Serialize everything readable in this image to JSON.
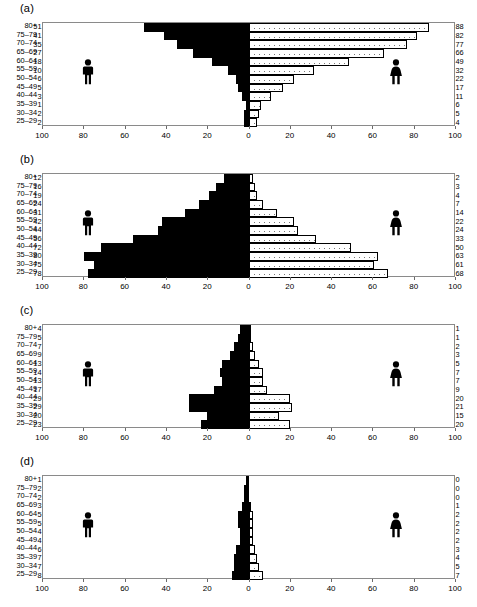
{
  "figure": {
    "axis": {
      "y_categories": [
        "80+",
        "75–79",
        "70–74",
        "65–69",
        "60–64",
        "55–59",
        "50–54",
        "45–49",
        "40–44",
        "35–39",
        "30–34",
        "25–29"
      ],
      "x_ticks": [
        "100",
        "80",
        "60",
        "40",
        "20",
        "0",
        "20",
        "40",
        "60",
        "80",
        "100"
      ],
      "x_max": 100
    },
    "icons": {
      "male": "male-figure-icon",
      "female": "female-figure-icon"
    }
  },
  "chart_data": [
    {
      "type": "bar",
      "title": "(a)",
      "subtitle": "",
      "xlabel": "",
      "ylabel": "",
      "orientation": "population-pyramid",
      "categories": [
        "80+",
        "75–79",
        "70–74",
        "65–69",
        "60–64",
        "55–59",
        "50–54",
        "45–49",
        "40–44",
        "35–39",
        "30–34",
        "25–29"
      ],
      "xlim": [
        0,
        100
      ],
      "grid": false,
      "legend": "figure-icons",
      "series": [
        {
          "name": "male",
          "side": "left",
          "fill": "solid-black",
          "values": [
            51,
            41,
            35,
            27,
            18,
            10,
            6,
            5,
            3,
            1,
            2,
            2
          ]
        },
        {
          "name": "female",
          "side": "right",
          "fill": "stippled",
          "values": [
            88,
            82,
            77,
            66,
            49,
            32,
            22,
            17,
            11,
            6,
            5,
            4
          ]
        }
      ]
    },
    {
      "type": "bar",
      "title": "(b)",
      "subtitle": "",
      "xlabel": "",
      "ylabel": "",
      "orientation": "population-pyramid",
      "categories": [
        "80+",
        "75–79",
        "70–74",
        "65–69",
        "60–64",
        "55–59",
        "50–54",
        "45–49",
        "40–44",
        "35–39",
        "30–34",
        "25–29"
      ],
      "xlim": [
        0,
        100
      ],
      "grid": false,
      "legend": "figure-icons",
      "series": [
        {
          "name": "male",
          "side": "left",
          "fill": "solid-black",
          "values": [
            12,
            16,
            19,
            24,
            31,
            42,
            44,
            56,
            72,
            80,
            75,
            78
          ]
        },
        {
          "name": "female",
          "side": "right",
          "fill": "stippled",
          "values": [
            2,
            3,
            4,
            7,
            14,
            22,
            24,
            33,
            50,
            63,
            61,
            68
          ]
        }
      ]
    },
    {
      "type": "bar",
      "title": "(c)",
      "subtitle": "",
      "xlabel": "",
      "ylabel": "",
      "orientation": "population-pyramid",
      "categories": [
        "80+",
        "75–79",
        "70–74",
        "65–69",
        "60–64",
        "55–59",
        "50–54",
        "45–49",
        "40–44",
        "35–39",
        "30–34",
        "25–29"
      ],
      "xlim": [
        0,
        100
      ],
      "grid": false,
      "legend": "figure-icons",
      "series": [
        {
          "name": "male",
          "side": "left",
          "fill": "solid-black",
          "values": [
            4,
            5,
            7,
            9,
            13,
            14,
            13,
            17,
            29,
            29,
            20,
            23
          ]
        },
        {
          "name": "female",
          "side": "right",
          "fill": "stippled",
          "values": [
            1,
            1,
            2,
            3,
            5,
            7,
            7,
            9,
            20,
            21,
            15,
            20
          ]
        }
      ]
    },
    {
      "type": "bar",
      "title": "(d)",
      "subtitle": "",
      "xlabel": "",
      "ylabel": "",
      "orientation": "population-pyramid",
      "categories": [
        "80+",
        "75–79",
        "70–74",
        "65–69",
        "60–64",
        "55–59",
        "50–54",
        "45–49",
        "40–44",
        "35–39",
        "30–34",
        "25–29"
      ],
      "xlim": [
        0,
        100
      ],
      "grid": false,
      "legend": "figure-icons",
      "series": [
        {
          "name": "male",
          "side": "left",
          "fill": "solid-black",
          "values": [
            1,
            2,
            2,
            3,
            5,
            5,
            4,
            4,
            6,
            7,
            7,
            8
          ]
        },
        {
          "name": "female",
          "side": "right",
          "fill": "stippled",
          "values": [
            0,
            0,
            0,
            1,
            2,
            2,
            2,
            2,
            3,
            4,
            5,
            7
          ]
        }
      ]
    }
  ]
}
